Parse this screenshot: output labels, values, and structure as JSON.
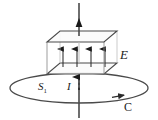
{
  "figure": {
    "name": "capacitor-ampere-loop-diagram",
    "width": 158,
    "height": 120,
    "background": "#ffffff",
    "stroke_color": "#3a3a3a",
    "plate_fill": "#fbfbfb",
    "ink_color": "#1a1a1a"
  },
  "labels": {
    "field": "E",
    "surface": "S",
    "surface_sub": "1",
    "current": "I",
    "loop": "C"
  },
  "geometry": {
    "wire": {
      "x": 79,
      "top_y": 2,
      "bottom_y": 118,
      "top_arrow_y": 21,
      "loop_arrow_y": 79
    },
    "top_plate": {
      "points": "60,31 117,31 104,42 47,42"
    },
    "bottom_plate": {
      "points": "60,63 117,63 104,74 47,74"
    },
    "field_lines_x": [
      63,
      77,
      91,
      105
    ],
    "field_line_top_y": 48,
    "field_line_bottom_y": 67,
    "ellipse": {
      "cx": 79,
      "cy": 88,
      "rx": 69,
      "ry": 15
    },
    "loop_direction_arrow": {
      "x": 121,
      "y": 96
    }
  },
  "elements": {
    "top_plate_name": "capacitor-top-plate",
    "bottom_plate_name": "capacitor-bottom-plate",
    "wire_name": "current-carrying-wire",
    "loop_name": "amperian-loop-c",
    "field_group_name": "electric-field-lines"
  }
}
